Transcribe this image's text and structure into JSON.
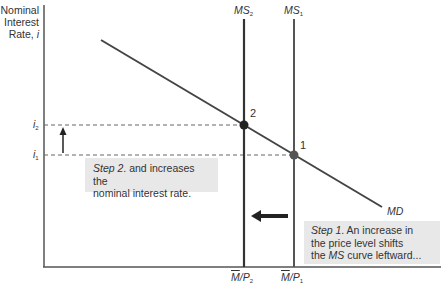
{
  "diagram": {
    "type": "money-market-diagram",
    "y_axis_label_lines": [
      "Nominal",
      "Interest",
      "Rate, i"
    ],
    "y_axis_label": {
      "line1": "Nominal",
      "line2": "Interest",
      "line3_text": "Rate, ",
      "line3_var": "i"
    },
    "curves": {
      "ms2": {
        "name": "MS",
        "sub": "2"
      },
      "ms1": {
        "name": "MS",
        "sub": "1"
      },
      "md": {
        "name": "MD"
      }
    },
    "y_ticks": {
      "i2": {
        "var": "i",
        "sub": "2"
      },
      "i1": {
        "var": "i",
        "sub": "1"
      }
    },
    "x_ticks": {
      "mp2": {
        "m": "M",
        "rest": "/P",
        "sub": "2"
      },
      "mp1": {
        "m": "M",
        "rest": "/P",
        "sub": "1"
      }
    },
    "points": {
      "p1": {
        "label": "1"
      },
      "p2": {
        "label": "2"
      }
    },
    "annotations": {
      "step2": {
        "step": "Step 2",
        "text_a": ". and increases the",
        "text_b": "nominal interest rate."
      },
      "step1": {
        "step": "Step 1",
        "text_a": ". An increase in",
        "text_b": "the price level shifts",
        "text_c_pre": "the ",
        "text_c_var": "MS",
        "text_c_post": " curve leftward..."
      }
    },
    "colors": {
      "axis": "#555555",
      "curve": "#444444",
      "point": "#333333",
      "dashed": "#666666",
      "box_bg": "#e8e8e8"
    }
  }
}
